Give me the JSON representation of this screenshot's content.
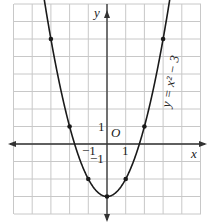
{
  "chart_data": {
    "type": "line",
    "title": "",
    "function": "y = x^2 - 3",
    "curve_label": "y = x² − 3",
    "xlabel": "x",
    "ylabel": "y",
    "origin_label": "O",
    "tick_labels": {
      "x": [
        "−1",
        "1"
      ],
      "y": [
        "1",
        "−1"
      ]
    },
    "xlim": [
      -5,
      5
    ],
    "ylim": [
      -4,
      8
    ],
    "grid": true,
    "points": [
      {
        "x": -3,
        "y": 6
      },
      {
        "x": -2,
        "y": 1
      },
      {
        "x": -1,
        "y": -2
      },
      {
        "x": 0,
        "y": -3
      },
      {
        "x": 1,
        "y": -2
      },
      {
        "x": 2,
        "y": 1
      },
      {
        "x": 3,
        "y": 6
      }
    ],
    "colors": {
      "grid": "#c8c8c8",
      "axis": "#333333",
      "curve": "#1a1a1a"
    }
  }
}
